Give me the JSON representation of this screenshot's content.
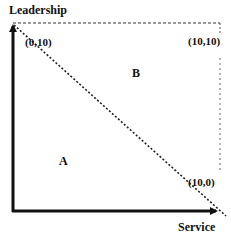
{
  "diagram": {
    "axes": {
      "y_label": "Leadership",
      "x_label": "Service"
    },
    "points": [
      {
        "label": "(0,10)"
      },
      {
        "label": "(10,10)"
      },
      {
        "label": "(10,0)"
      }
    ],
    "regions": [
      {
        "label": "A"
      },
      {
        "label": "B"
      }
    ],
    "colors": {
      "axis": "#111111",
      "dashed": "#333333",
      "background": "#ffffff"
    }
  }
}
